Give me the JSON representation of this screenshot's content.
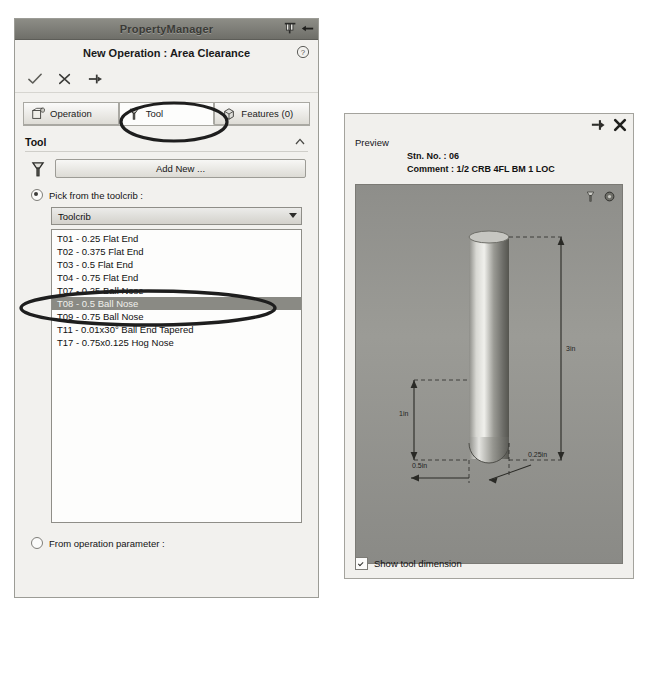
{
  "property_manager": {
    "window_title": "PropertyManager",
    "titlebar_icons": [
      "pin-icon",
      "arrow-left-icon"
    ],
    "header_title": "New Operation : Area Clearance",
    "help_icon": "help-icon",
    "action_icons": [
      "accept-check-icon",
      "cancel-x-icon",
      "pin-icon"
    ],
    "tabs": [
      {
        "label": "Operation",
        "icon": "operation-icon",
        "active": false
      },
      {
        "label": "Tool",
        "icon": "tool-icon",
        "active": true
      },
      {
        "label": "Features (0)",
        "icon": "features-icon",
        "active": false
      }
    ],
    "section": {
      "title": "Tool",
      "collapse_icon": "chevron-up-icon",
      "tool_icon": "tool-icon",
      "add_new_label": "Add New ..."
    },
    "pick_toolcrib": {
      "label": "Pick from the toolcrib :",
      "selected": true,
      "combo_value": "Toolcrib",
      "combo_arrow_icon": "chevron-down-icon"
    },
    "tool_list": [
      {
        "label": "T01 - 0.25 Flat End",
        "selected": false
      },
      {
        "label": "T02 - 0.375 Flat End",
        "selected": false
      },
      {
        "label": "T03 - 0.5 Flat End",
        "selected": false
      },
      {
        "label": "T04 - 0.75 Flat End",
        "selected": false
      },
      {
        "label": "T07 - 0.25 Ball Nose",
        "selected": false
      },
      {
        "label": "T08 - 0.5 Ball Nose",
        "selected": true
      },
      {
        "label": "T09 - 0.75 Ball Nose",
        "selected": false
      },
      {
        "label": "T11 - 0.01x30° Ball End Tapered",
        "selected": false
      },
      {
        "label": "T17 - 0.75x0.125 Hog Nose",
        "selected": false
      }
    ],
    "from_operation": {
      "label": "From operation parameter :",
      "selected": false
    }
  },
  "preview_panel": {
    "top_icons": [
      "pin-icon",
      "close-x-icon"
    ],
    "label": "Preview",
    "station_label": "Stn. No. :",
    "station_value": "06",
    "comment_label": "Comment :",
    "comment_value": "1/2 CRB 4FL BM 1 LOC",
    "image_icons": [
      "tool-icon",
      "settings-icon"
    ],
    "dimensions": [
      {
        "name": "length",
        "text": "3in"
      },
      {
        "name": "flute-length",
        "text": "1in"
      },
      {
        "name": "diameter",
        "text": "0.5in"
      },
      {
        "name": "radius",
        "text": "0.25in"
      }
    ],
    "show_dimension": {
      "label": "Show tool dimension",
      "checked": true
    }
  },
  "annotations": [
    {
      "name": "tool-tab-highlight",
      "shape": "ellipse"
    },
    {
      "name": "selected-tool-highlight",
      "shape": "ellipse"
    }
  ],
  "colors": {
    "panel_bg": "#f2f1ee",
    "titlebar": "#7d7d77",
    "selection": "#8a8a84",
    "preview_bg": "#92928e"
  }
}
